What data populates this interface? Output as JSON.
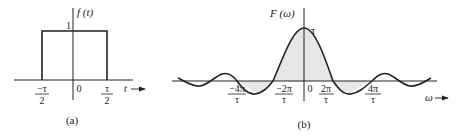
{
  "figure_a": {
    "caption": "(a)",
    "y_label": "f (t)",
    "x_label": "t",
    "height_label": "1",
    "ticks": [
      {
        "num": "−τ",
        "den": "2"
      },
      {
        "num": "0",
        "den": ""
      },
      {
        "num": "τ",
        "den": "2"
      }
    ]
  },
  "figure_b": {
    "caption": "(b)",
    "y_label": "F (ω)",
    "x_label": "ω",
    "peak_label": "τ",
    "ticks": [
      {
        "num": "−4π",
        "den": "τ"
      },
      {
        "num": "−2π",
        "den": "τ"
      },
      {
        "num": "0",
        "den": ""
      },
      {
        "num": "2π",
        "den": "τ"
      },
      {
        "num": "4π",
        "den": "τ"
      }
    ]
  },
  "colors": {
    "line": "#222222",
    "fill": "#e6e6e6"
  }
}
